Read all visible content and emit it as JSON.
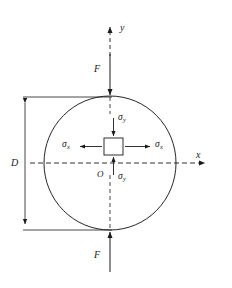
{
  "figure": {
    "background_color": "#ffffff",
    "line_color": "#1a1a1a",
    "axes": {
      "y_label": "y",
      "x_label": "x",
      "origin_label": "O"
    },
    "loads": {
      "top_force_label": "F",
      "bottom_force_label": "F"
    },
    "dimension": {
      "diameter_label": "D"
    },
    "stress_element": {
      "sigma_symbol": "σ",
      "top_label": "σ",
      "top_subscript": "y",
      "bottom_label": "σ",
      "bottom_subscript": "y",
      "left_label": "σ",
      "left_subscript": "x",
      "right_label": "σ",
      "right_subscript": "x"
    },
    "geometry": {
      "circle_center_x": 110,
      "circle_center_y": 163,
      "circle_radius_x": 66,
      "circle_radius_y": 67,
      "square_left": 104,
      "square_top": 138,
      "square_size": 19
    }
  }
}
